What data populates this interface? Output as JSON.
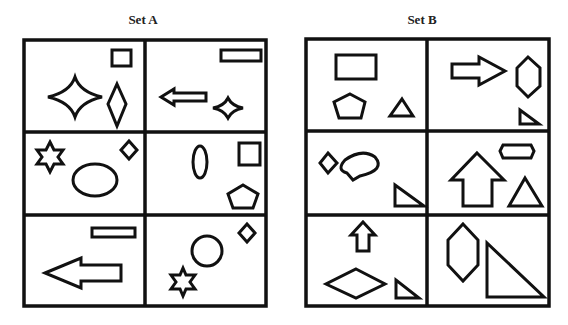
{
  "sets": [
    {
      "title": "Set A",
      "cells": [
        [
          "square",
          "four-point-star",
          "diamond"
        ],
        [
          "wide-rectangle",
          "left-arrow",
          "small-four-point-star"
        ],
        [
          "six-point-star",
          "diamond",
          "ellipse"
        ],
        [
          "vertical-ellipse",
          "square",
          "pentagon"
        ],
        [
          "wide-rectangle",
          "large-left-arrow"
        ],
        [
          "diamond",
          "circle",
          "six-point-star"
        ]
      ]
    },
    {
      "title": "Set B",
      "cells": [
        [
          "rectangle",
          "pentagon",
          "triangle"
        ],
        [
          "right-arrow",
          "hexagon",
          "right-triangle"
        ],
        [
          "diamond",
          "speech-bubble",
          "right-triangle"
        ],
        [
          "hexagon",
          "up-arrow",
          "triangle"
        ],
        [
          "up-arrow",
          "wide-diamond",
          "right-triangle"
        ],
        [
          "tall-hexagon",
          "large-right-triangle"
        ]
      ]
    }
  ]
}
